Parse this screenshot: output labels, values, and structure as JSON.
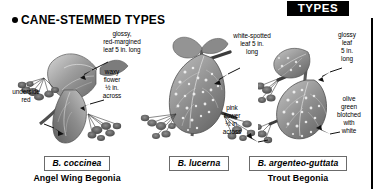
{
  "page": {
    "tab_label": "TYPES",
    "section_heading": "CANE-STEMMED TYPES"
  },
  "callouts": [
    {
      "id": "glossy-red-margined-leaf",
      "text": "glossy,\nred-margined\nleaf 5 in. long"
    },
    {
      "id": "waxy-flower",
      "text": "waxy\nflower\n½ in.\nacross"
    },
    {
      "id": "underside-red",
      "text": "underside\nred"
    },
    {
      "id": "white-spotted-leaf",
      "text": "white-spotted\nleaf 5 in.\nlong"
    },
    {
      "id": "pink-flower",
      "text": "pink\nflower\n½ in.\nacross"
    },
    {
      "id": "glossy-leaf",
      "text": "glossy\nleaf\n5 in.\nlong"
    },
    {
      "id": "olive-green-blotched",
      "text": "olive\ngreen\nblotched\nwith\nwhite"
    }
  ],
  "specimens": [
    {
      "latin": "B. coccinea",
      "common": "Angel Wing Begonia"
    },
    {
      "latin": "B. lucerna",
      "common": ""
    },
    {
      "latin": "B. argenteo-guttata",
      "common": "Trout Begonia"
    }
  ],
  "colors": {
    "ink": "#000000",
    "paper": "#ffffff",
    "box_border": "#6b6b6b",
    "leaf_mid": "#9a9a9a",
    "leaf_dark": "#6e6e6e",
    "leaf_light": "#c8c8c8"
  }
}
